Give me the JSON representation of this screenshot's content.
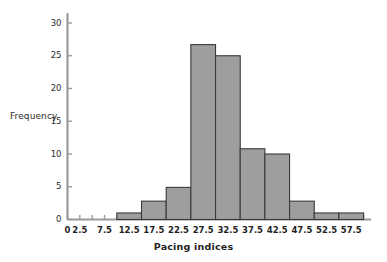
{
  "chart_data": {
    "type": "bar",
    "title": "",
    "xlabel": "Pacing indices",
    "ylabel": "Frequency",
    "bin_width": 5,
    "bin_starts": [
      10,
      15,
      20,
      25,
      30,
      35,
      40,
      45,
      50,
      55
    ],
    "bin_ends": [
      15,
      20,
      25,
      30,
      35,
      40,
      45,
      50,
      55,
      60
    ],
    "categories": [
      "10-15",
      "15-20",
      "20-25",
      "25-30",
      "30-35",
      "35-40",
      "40-45",
      "45-50",
      "50-55",
      "55-60"
    ],
    "values": [
      1,
      2.8,
      4.9,
      26.7,
      25,
      10.8,
      10,
      2.8,
      1,
      1
    ],
    "xlim": [
      0,
      61.5
    ],
    "ylim": [
      0,
      31.5
    ],
    "x_major_ticks": [
      0,
      2.5,
      5,
      7.5,
      10,
      12.5,
      15,
      17.5,
      20,
      22.5,
      25,
      27.5,
      30,
      32.5,
      35,
      37.5,
      40,
      42.5,
      45,
      47.5,
      50,
      52.5,
      55,
      57.5,
      60
    ],
    "x_tick_labels": [
      {
        "value": 0,
        "label": "0"
      },
      {
        "value": 2.5,
        "label": "2.5"
      },
      {
        "value": 7.5,
        "label": "7.5"
      },
      {
        "value": 12.5,
        "label": "12.5"
      },
      {
        "value": 17.5,
        "label": "17.5"
      },
      {
        "value": 22.5,
        "label": "22.5"
      },
      {
        "value": 27.5,
        "label": "27.5"
      },
      {
        "value": 32.5,
        "label": "32.5"
      },
      {
        "value": 37.5,
        "label": "37.5"
      },
      {
        "value": 42.5,
        "label": "42.5"
      },
      {
        "value": 47.5,
        "label": "47.5"
      },
      {
        "value": 52.5,
        "label": "52.5"
      },
      {
        "value": 57.5,
        "label": "57.5"
      }
    ],
    "y_ticks": [
      0,
      5,
      10,
      15,
      20,
      25,
      30
    ],
    "y_tick_labels": [
      "0",
      "5",
      "10",
      "15",
      "20",
      "25",
      "30"
    ],
    "grid": false,
    "legend": null,
    "bar_fill_color": "#9e9e9e",
    "bar_edge_color": "#3a3a3a",
    "axis_color": "#9a9a9a",
    "text_color": "#2b2b2b",
    "background_color": "#ffffff"
  }
}
